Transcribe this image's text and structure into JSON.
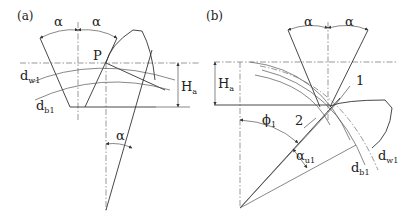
{
  "figure": {
    "panels": [
      {
        "id": "a",
        "label": "(a)",
        "symbols": {
          "alpha_left": "α",
          "alpha_right": "α",
          "alpha_bottom": "α",
          "pitch_point": "P",
          "dw_main": "d",
          "dw_sub": "w1",
          "db_main": "d",
          "db_sub": "b1",
          "Ha_main": "H",
          "Ha_sub": "a"
        }
      },
      {
        "id": "b",
        "label": "(b)",
        "symbols": {
          "alpha_left": "α",
          "alpha_right": "α",
          "Ha_main": "H",
          "Ha_sub": "a",
          "point1": "1",
          "point2": "2",
          "phi_main": "ϕ",
          "phi_sub": "1",
          "alpha_u_main": "α",
          "alpha_u_sub": "u1",
          "db_main": "d",
          "db_sub": "b1",
          "dw_main": "d",
          "dw_sub": "w1"
        }
      }
    ]
  }
}
